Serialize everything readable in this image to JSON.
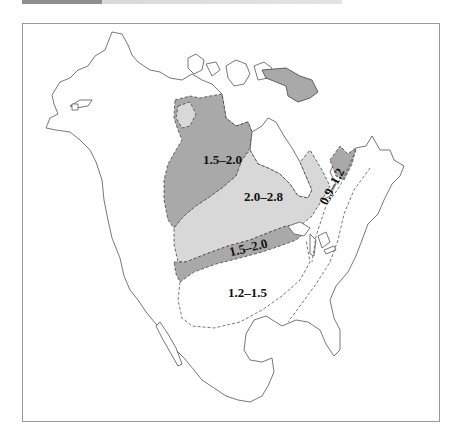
{
  "map": {
    "title": "",
    "region": "North America",
    "colors": {
      "zone_dark": "#a9a9a9",
      "zone_light": "#d8d8d8",
      "coastline": "#555555",
      "frame": "#9a9a9a"
    },
    "zones": [
      {
        "id": "nw",
        "label": "1.5–2.0",
        "shade": "dark"
      },
      {
        "id": "central",
        "label": "2.0–2.8",
        "shade": "light"
      },
      {
        "id": "band",
        "label": "1.5–2.0",
        "shade": "dark"
      },
      {
        "id": "south",
        "label": "1.2–1.5",
        "shade": "none"
      },
      {
        "id": "east",
        "label": "0.9–1.2",
        "shade": "none"
      }
    ]
  }
}
